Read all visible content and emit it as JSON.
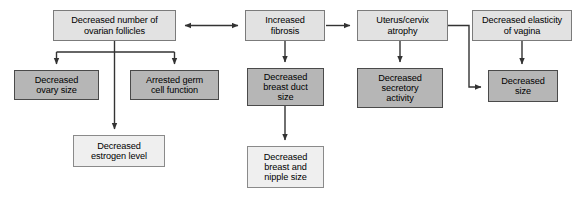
{
  "diagram": {
    "canvas": {
      "width": 583,
      "height": 197,
      "background": "#ffffff"
    },
    "palette": {
      "dark_fill": "#b6b6b6",
      "dark_border": "#4a4a4a",
      "light_fill": "#e2e2e2",
      "light_border": "#7b7b7b",
      "pale_fill": "#efefef",
      "pale_border": "#8a8a8a",
      "line": "#333333",
      "text": "#000000"
    },
    "nodes": [
      {
        "id": "ovarian-follicles",
        "label": "Decreased number of\novarian follicles",
        "shade": "light",
        "x": 53,
        "y": 10,
        "w": 123,
        "h": 31,
        "font_size": 9.2
      },
      {
        "id": "ovary-size",
        "label": "Decreased\novary size",
        "shade": "dark",
        "x": 14,
        "y": 70,
        "w": 85,
        "h": 30,
        "font_size": 9.2
      },
      {
        "id": "germ-cell-function",
        "label": "Arrested germ\ncell function",
        "shade": "dark",
        "x": 130,
        "y": 70,
        "w": 89,
        "h": 30,
        "font_size": 9.2
      },
      {
        "id": "estrogen-level",
        "label": "Decreased\nestrogen level",
        "shade": "pale",
        "x": 73,
        "y": 135,
        "w": 92,
        "h": 32,
        "font_size": 9.2
      },
      {
        "id": "fibrosis",
        "label": "Increased\nfibrosis",
        "shade": "light",
        "x": 245,
        "y": 10,
        "w": 80,
        "h": 31,
        "font_size": 9.2
      },
      {
        "id": "breast-duct-size",
        "label": "Decreased\nbreast duct\nsize",
        "shade": "dark",
        "x": 247,
        "y": 68,
        "w": 77,
        "h": 38,
        "font_size": 9.2
      },
      {
        "id": "breast-nipple-size",
        "label": "Decreased\nbreast and\nnipple size",
        "shade": "pale",
        "x": 247,
        "y": 146,
        "w": 77,
        "h": 42,
        "font_size": 9.2
      },
      {
        "id": "uterus-cervix-atrophy",
        "label": "Uterus/cervix\natrophy",
        "shade": "light",
        "x": 357,
        "y": 10,
        "w": 91,
        "h": 31,
        "font_size": 9.2
      },
      {
        "id": "secretory-activity",
        "label": "Decreased\nsecretory\nactivity",
        "shade": "dark",
        "x": 357,
        "y": 68,
        "w": 86,
        "h": 40,
        "font_size": 9.2
      },
      {
        "id": "vaginal-elasticity",
        "label": "Decreased elasticity\nof vagina",
        "shade": "light",
        "x": 472,
        "y": 10,
        "w": 100,
        "h": 31,
        "font_size": 9.2
      },
      {
        "id": "decreased-size",
        "label": "Decreased\nsize",
        "shade": "dark",
        "x": 488,
        "y": 70,
        "w": 70,
        "h": 32,
        "font_size": 9.2
      }
    ],
    "edges": [
      {
        "id": "follicles-to-fibrosis",
        "type": "bidirectional-horizontal",
        "from": "ovarian-follicles",
        "to": "fibrosis"
      },
      {
        "id": "fibrosis-to-uterus",
        "type": "arrow-horizontal",
        "from": "fibrosis",
        "to": "uterus-cervix-atrophy"
      },
      {
        "id": "follicles-to-ovary-size",
        "type": "branch-down",
        "from": "ovarian-follicles",
        "to": "ovary-size"
      },
      {
        "id": "follicles-to-germ-cell",
        "type": "branch-down",
        "from": "ovarian-follicles",
        "to": "germ-cell-function"
      },
      {
        "id": "follicles-to-estrogen",
        "type": "straight-down",
        "from": "ovarian-follicles",
        "to": "estrogen-level"
      },
      {
        "id": "fibrosis-to-breast-duct",
        "type": "straight-down",
        "from": "fibrosis",
        "to": "breast-duct-size"
      },
      {
        "id": "breast-duct-to-nipple",
        "type": "straight-down",
        "from": "breast-duct-size",
        "to": "breast-nipple-size"
      },
      {
        "id": "uterus-to-secretory",
        "type": "straight-down",
        "from": "uterus-cervix-atrophy",
        "to": "secretory-activity"
      },
      {
        "id": "uterus-to-decreased-size",
        "type": "elbow-right-down",
        "from": "uterus-cervix-atrophy",
        "to": "decreased-size"
      },
      {
        "id": "vaginal-elasticity-to-decreased-size",
        "type": "straight-down",
        "from": "vaginal-elasticity",
        "to": "decreased-size"
      }
    ]
  }
}
